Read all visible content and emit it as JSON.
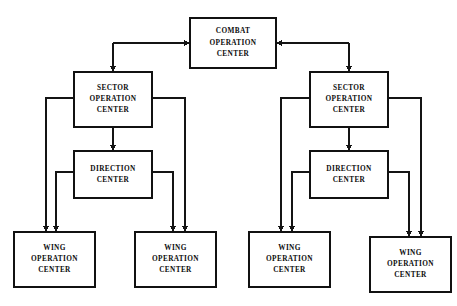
{
  "diagram": {
    "type": "block-diagram",
    "canvas": {
      "width": 457,
      "height": 306
    },
    "style": {
      "background": "#ffffff",
      "line_color": "#141414",
      "box_fill": "#ffffff",
      "box_stroke": "#111111",
      "text_color": "#0d0d0d"
    },
    "nodes": [
      {
        "id": "coc",
        "name": "combat-operation-center",
        "lines": [
          "COMBAT",
          "OPERATION",
          "CENTER"
        ],
        "x": 190,
        "y": 18,
        "w": 86,
        "h": 50
      },
      {
        "id": "soc-left",
        "name": "sector-operation-center-left",
        "lines": [
          "SECTOR",
          "OPERATION",
          "CENTER"
        ],
        "x": 74,
        "y": 72,
        "w": 78,
        "h": 55
      },
      {
        "id": "soc-right",
        "name": "sector-operation-center-right",
        "lines": [
          "SECTOR",
          "OPERATION",
          "CENTER"
        ],
        "x": 310,
        "y": 72,
        "w": 78,
        "h": 55
      },
      {
        "id": "dc-left",
        "name": "direction-center-left",
        "lines": [
          "DIRECTION",
          "CENTER"
        ],
        "x": 74,
        "y": 151,
        "w": 78,
        "h": 47
      },
      {
        "id": "dc-right",
        "name": "direction-center-right",
        "lines": [
          "DIRECTION",
          "CENTER"
        ],
        "x": 310,
        "y": 151,
        "w": 78,
        "h": 47
      },
      {
        "id": "woc-1",
        "name": "wing-operation-center-1",
        "lines": [
          "WING",
          "OPERATION",
          "CENTER"
        ],
        "x": 14,
        "y": 232,
        "w": 81,
        "h": 55
      },
      {
        "id": "woc-2",
        "name": "wing-operation-center-2",
        "lines": [
          "WING",
          "OPERATION",
          "CENTER"
        ],
        "x": 135,
        "y": 232,
        "w": 81,
        "h": 55
      },
      {
        "id": "woc-3",
        "name": "wing-operation-center-3",
        "lines": [
          "WING",
          "OPERATION",
          "CENTER"
        ],
        "x": 249,
        "y": 232,
        "w": 81,
        "h": 55
      },
      {
        "id": "woc-4",
        "name": "wing-operation-center-4",
        "lines": [
          "WING",
          "OPERATION",
          "CENTER"
        ],
        "x": 370,
        "y": 237,
        "w": 81,
        "h": 55
      }
    ],
    "edges": [
      {
        "id": "e1",
        "name": "edge-soc-left-to-coc",
        "from": "soc-left",
        "to": "coc",
        "path": "M 113 43 L 190 43",
        "arrow": {
          "x": 190,
          "y": 43,
          "dir": "right"
        }
      },
      {
        "id": "e2",
        "name": "edge-coc-to-soc-left",
        "from": "coc",
        "to": "soc-left",
        "path": "M 113 43 L 113 72",
        "arrow": {
          "x": 113,
          "y": 72,
          "dir": "down"
        }
      },
      {
        "id": "e3",
        "name": "edge-soc-right-to-coc",
        "from": "soc-right",
        "to": "coc",
        "path": "M 349 43 L 276 43",
        "arrow": {
          "x": 276,
          "y": 43,
          "dir": "left"
        }
      },
      {
        "id": "e4",
        "name": "edge-coc-to-soc-right",
        "from": "coc",
        "to": "soc-right",
        "path": "M 349 43 L 349 72",
        "arrow": {
          "x": 349,
          "y": 72,
          "dir": "down"
        }
      },
      {
        "id": "e5",
        "name": "edge-soc-left-to-dc-left",
        "from": "soc-left",
        "to": "dc-left",
        "path": "M 113 127 L 113 151",
        "arrow": {
          "x": 113,
          "y": 151,
          "dir": "down"
        }
      },
      {
        "id": "e6",
        "name": "edge-soc-right-to-dc-right",
        "from": "soc-right",
        "to": "dc-right",
        "path": "M 349 127 L 349 151",
        "arrow": {
          "x": 349,
          "y": 151,
          "dir": "down"
        }
      },
      {
        "id": "e7",
        "name": "edge-soc-left-to-woc-1",
        "from": "soc-left",
        "to": "woc-1",
        "path": "M 74 98 L 46 98 L 46 232",
        "arrow": {
          "x": 46,
          "y": 232,
          "dir": "down"
        }
      },
      {
        "id": "e8",
        "name": "edge-dc-left-to-woc-1",
        "from": "dc-left",
        "to": "woc-1",
        "path": "M 74 172 L 56 172 L 56 232",
        "arrow": {
          "x": 56,
          "y": 232,
          "dir": "down"
        }
      },
      {
        "id": "e9",
        "name": "edge-soc-left-to-woc-2",
        "from": "soc-left",
        "to": "woc-2",
        "path": "M 152 98 L 185 98 L 185 232",
        "arrow": {
          "x": 185,
          "y": 232,
          "dir": "down"
        }
      },
      {
        "id": "e10",
        "name": "edge-dc-left-to-woc-2",
        "from": "dc-left",
        "to": "woc-2",
        "path": "M 152 172 L 173 172 L 173 232",
        "arrow": {
          "x": 173,
          "y": 232,
          "dir": "down"
        }
      },
      {
        "id": "e11",
        "name": "edge-soc-right-to-woc-3",
        "from": "soc-right",
        "to": "woc-3",
        "path": "M 310 98 L 281 98 L 281 232",
        "arrow": {
          "x": 281,
          "y": 232,
          "dir": "down"
        }
      },
      {
        "id": "e12",
        "name": "edge-dc-right-to-woc-3",
        "from": "dc-right",
        "to": "woc-3",
        "path": "M 310 172 L 292 172 L 292 232",
        "arrow": {
          "x": 292,
          "y": 232,
          "dir": "down"
        }
      },
      {
        "id": "e13",
        "name": "edge-soc-right-to-woc-4",
        "from": "soc-right",
        "to": "woc-4",
        "path": "M 388 98 L 421 98 L 421 237",
        "arrow": {
          "x": 421,
          "y": 237,
          "dir": "down"
        }
      },
      {
        "id": "e14",
        "name": "edge-dc-right-to-woc-4",
        "from": "dc-right",
        "to": "woc-4",
        "path": "M 388 172 L 409 172 L 409 237",
        "arrow": {
          "x": 409,
          "y": 237,
          "dir": "down"
        }
      }
    ]
  }
}
